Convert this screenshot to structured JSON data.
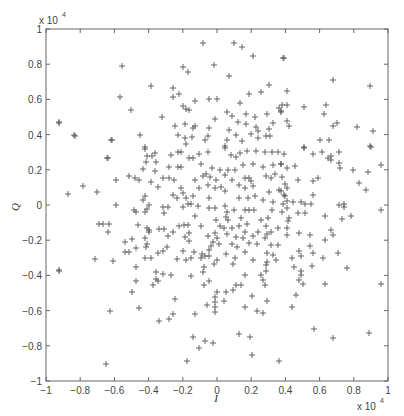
{
  "chart_data": {
    "type": "scatter",
    "title": "",
    "xlabel": "I",
    "ylabel": "Q",
    "x_multiplier_label": "x 10",
    "x_multiplier_exp": "4",
    "y_multiplier_label": "x 10",
    "y_multiplier_exp": "4",
    "xlim": [
      -1,
      1
    ],
    "ylim": [
      -1,
      1
    ],
    "grid": false,
    "legend": null,
    "marker": "+",
    "marker_color": "#555555",
    "axis_color": "#666666",
    "x_ticks": [
      -1,
      -0.8,
      -0.6,
      -0.4,
      -0.2,
      0,
      0.2,
      0.4,
      0.6,
      0.8,
      1
    ],
    "y_ticks": [
      -1,
      -0.8,
      -0.6,
      -0.4,
      -0.2,
      0,
      0.2,
      0.4,
      0.6,
      0.8,
      1
    ],
    "x_tick_labels": [
      "−1",
      "−0.8",
      "−0.6",
      "−0.4",
      "−0.2",
      "0",
      "0.2",
      "0.4",
      "0.6",
      "0.8",
      "1"
    ],
    "y_tick_labels": [
      "−1",
      "−0.8",
      "−0.6",
      "−0.4",
      "−0.2",
      "0",
      "0.2",
      "0.4",
      "0.6",
      "0.8",
      "1"
    ],
    "units_note": "values in units of 10^4",
    "points_px": [
      [
        122,
        66
      ],
      [
        151,
        86
      ],
      [
        120,
        97
      ],
      [
        131,
        110
      ],
      [
        162,
        117
      ],
      [
        59,
        122
      ],
      [
        75,
        136
      ],
      [
        112,
        140
      ],
      [
        140,
        135
      ],
      [
        145,
        147
      ],
      [
        203,
        43
      ],
      [
        234,
        43
      ],
      [
        242,
        47
      ],
      [
        253,
        56
      ],
      [
        283,
        58
      ],
      [
        183,
        67
      ],
      [
        188,
        72
      ],
      [
        214,
        65
      ],
      [
        229,
        76
      ],
      [
        173,
        88
      ],
      [
        173,
        97
      ],
      [
        179,
        94
      ],
      [
        195,
        101
      ],
      [
        209,
        99
      ],
      [
        217,
        99
      ],
      [
        240,
        103
      ],
      [
        249,
        94
      ],
      [
        261,
        92
      ],
      [
        269,
        85
      ],
      [
        183,
        106
      ],
      [
        186,
        109
      ],
      [
        189,
        110
      ],
      [
        227,
        112
      ],
      [
        232,
        116
      ],
      [
        246,
        114
      ],
      [
        255,
        117
      ],
      [
        267,
        114
      ],
      [
        279,
        108
      ],
      [
        281,
        112
      ],
      [
        215,
        119
      ],
      [
        238,
        122
      ],
      [
        246,
        124
      ],
      [
        273,
        123
      ],
      [
        175,
        126
      ],
      [
        185,
        124
      ],
      [
        193,
        128
      ],
      [
        195,
        126
      ],
      [
        209,
        128
      ],
      [
        229,
        130
      ],
      [
        256,
        127
      ],
      [
        258,
        131
      ],
      [
        269,
        129
      ],
      [
        178,
        135
      ],
      [
        185,
        138
      ],
      [
        192,
        137
      ],
      [
        208,
        136
      ],
      [
        236,
        135
      ],
      [
        251,
        134
      ],
      [
        258,
        138
      ],
      [
        266,
        136
      ],
      [
        270,
        136
      ],
      [
        205,
        140
      ],
      [
        227,
        140
      ],
      [
        242,
        141
      ],
      [
        186,
        144
      ],
      [
        225,
        146
      ],
      [
        284,
        58
      ],
      [
        333,
        80
      ],
      [
        370,
        86
      ],
      [
        287,
        91
      ],
      [
        282,
        105
      ],
      [
        287,
        105
      ],
      [
        304,
        107
      ],
      [
        326,
        105
      ],
      [
        324,
        114
      ],
      [
        281,
        111
      ],
      [
        287,
        121
      ],
      [
        289,
        126
      ],
      [
        333,
        126
      ],
      [
        337,
        123
      ],
      [
        357,
        127
      ],
      [
        373,
        131
      ],
      [
        320,
        140
      ],
      [
        329,
        140
      ],
      [
        304,
        147
      ],
      [
        370,
        146
      ],
      [
        145,
        149
      ],
      [
        155,
        153
      ],
      [
        147,
        156
      ],
      [
        152,
        156
      ],
      [
        107,
        158
      ],
      [
        146,
        162
      ],
      [
        156,
        162
      ],
      [
        143,
        169
      ],
      [
        155,
        171
      ],
      [
        129,
        176
      ],
      [
        135,
        178
      ],
      [
        139,
        180
      ],
      [
        116,
        180
      ],
      [
        163,
        178
      ],
      [
        151,
        182
      ],
      [
        83,
        186
      ],
      [
        158,
        187
      ],
      [
        97,
        192
      ],
      [
        68,
        194
      ],
      [
        145,
        196
      ],
      [
        143,
        200
      ],
      [
        149,
        205
      ],
      [
        116,
        205
      ],
      [
        163,
        207
      ],
      [
        134,
        210
      ],
      [
        136,
        212
      ],
      [
        145,
        212
      ],
      [
        147,
        209
      ],
      [
        164,
        213
      ],
      [
        99,
        224
      ],
      [
        103,
        224
      ],
      [
        109,
        224
      ],
      [
        138,
        225
      ],
      [
        147,
        228
      ],
      [
        149,
        230
      ],
      [
        159,
        229
      ],
      [
        164,
        229
      ],
      [
        108,
        232
      ],
      [
        149,
        232
      ],
      [
        145,
        238
      ],
      [
        132,
        239
      ],
      [
        125,
        242
      ],
      [
        147,
        244
      ],
      [
        136,
        248
      ],
      [
        146,
        247
      ],
      [
        125,
        252
      ],
      [
        129,
        252
      ],
      [
        158,
        253
      ],
      [
        163,
        251
      ],
      [
        95,
        259
      ],
      [
        113,
        261
      ],
      [
        145,
        258
      ],
      [
        151,
        258
      ],
      [
        108,
        158
      ],
      [
        111,
        140
      ],
      [
        74,
        135
      ],
      [
        59,
        123
      ],
      [
        171,
        155
      ],
      [
        178,
        152
      ],
      [
        181,
        152
      ],
      [
        189,
        158
      ],
      [
        193,
        158
      ],
      [
        199,
        154
      ],
      [
        208,
        152
      ],
      [
        225,
        148
      ],
      [
        231,
        155
      ],
      [
        236,
        157
      ],
      [
        240,
        153
      ],
      [
        247,
        151
      ],
      [
        256,
        151
      ],
      [
        265,
        152
      ],
      [
        272,
        152
      ],
      [
        278,
        152
      ],
      [
        284,
        154
      ],
      [
        169,
        167
      ],
      [
        178,
        167
      ],
      [
        181,
        167
      ],
      [
        201,
        164
      ],
      [
        212,
        168
      ],
      [
        220,
        170
      ],
      [
        228,
        170
      ],
      [
        235,
        170
      ],
      [
        243,
        165
      ],
      [
        253,
        164
      ],
      [
        263,
        167
      ],
      [
        273,
        165
      ],
      [
        281,
        164
      ],
      [
        169,
        178
      ],
      [
        174,
        180
      ],
      [
        195,
        180
      ],
      [
        203,
        176
      ],
      [
        206,
        174
      ],
      [
        210,
        177
      ],
      [
        216,
        180
      ],
      [
        225,
        175
      ],
      [
        232,
        180
      ],
      [
        245,
        178
      ],
      [
        249,
        178
      ],
      [
        251,
        181
      ],
      [
        266,
        176
      ],
      [
        271,
        178
      ],
      [
        275,
        174
      ],
      [
        181,
        188
      ],
      [
        183,
        193
      ],
      [
        199,
        188
      ],
      [
        208,
        185
      ],
      [
        215,
        188
      ],
      [
        221,
        187
      ],
      [
        225,
        191
      ],
      [
        239,
        185
      ],
      [
        245,
        188
      ],
      [
        253,
        186
      ],
      [
        269,
        192
      ],
      [
        279,
        190
      ],
      [
        284,
        195
      ],
      [
        173,
        195
      ],
      [
        177,
        198
      ],
      [
        186,
        198
      ],
      [
        193,
        196
      ],
      [
        209,
        198
      ],
      [
        239,
        198
      ],
      [
        248,
        198
      ],
      [
        255,
        196
      ],
      [
        263,
        200
      ],
      [
        273,
        202
      ],
      [
        168,
        207
      ],
      [
        183,
        207
      ],
      [
        188,
        204
      ],
      [
        191,
        204
      ],
      [
        198,
        206
      ],
      [
        209,
        208
      ],
      [
        215,
        208
      ],
      [
        225,
        206
      ],
      [
        227,
        212
      ],
      [
        234,
        210
      ],
      [
        245,
        210
      ],
      [
        249,
        210
      ],
      [
        254,
        210
      ],
      [
        272,
        210
      ],
      [
        283,
        204
      ],
      [
        195,
        216
      ],
      [
        216,
        220
      ],
      [
        226,
        217
      ],
      [
        228,
        220
      ],
      [
        241,
        218
      ],
      [
        261,
        220
      ],
      [
        268,
        218
      ],
      [
        179,
        226
      ],
      [
        184,
        225
      ],
      [
        188,
        225
      ],
      [
        201,
        226
      ],
      [
        220,
        226
      ],
      [
        224,
        228
      ],
      [
        232,
        228
      ],
      [
        239,
        226
      ],
      [
        247,
        224
      ],
      [
        266,
        226
      ],
      [
        278,
        228
      ],
      [
        173,
        232
      ],
      [
        189,
        233
      ],
      [
        215,
        233
      ],
      [
        227,
        234
      ],
      [
        245,
        232
      ],
      [
        258,
        232
      ],
      [
        267,
        234
      ],
      [
        271,
        232
      ],
      [
        168,
        236
      ],
      [
        185,
        237
      ],
      [
        208,
        236
      ],
      [
        217,
        238
      ],
      [
        236,
        237
      ],
      [
        243,
        238
      ],
      [
        253,
        236
      ],
      [
        265,
        238
      ],
      [
        189,
        241
      ],
      [
        213,
        242
      ],
      [
        219,
        244
      ],
      [
        232,
        244
      ],
      [
        249,
        243
      ],
      [
        257,
        244
      ],
      [
        271,
        245
      ],
      [
        278,
        245
      ],
      [
        167,
        247
      ],
      [
        211,
        246
      ],
      [
        237,
        247
      ],
      [
        183,
        251
      ],
      [
        194,
        252
      ],
      [
        202,
        254
      ],
      [
        209,
        250
      ],
      [
        226,
        254
      ],
      [
        245,
        252
      ],
      [
        267,
        253
      ],
      [
        273,
        255
      ],
      [
        177,
        259
      ],
      [
        186,
        260
      ],
      [
        191,
        258
      ],
      [
        201,
        258
      ],
      [
        205,
        256
      ],
      [
        209,
        256
      ],
      [
        217,
        260
      ],
      [
        235,
        258
      ],
      [
        253,
        260
      ],
      [
        267,
        262
      ],
      [
        276,
        260
      ],
      [
        304,
        148
      ],
      [
        313,
        154
      ],
      [
        322,
        152
      ],
      [
        328,
        158
      ],
      [
        331,
        156
      ],
      [
        331,
        160
      ],
      [
        339,
        152
      ],
      [
        371,
        147
      ],
      [
        281,
        164
      ],
      [
        287,
        168
      ],
      [
        295,
        166
      ],
      [
        339,
        163
      ],
      [
        340,
        168
      ],
      [
        353,
        170
      ],
      [
        368,
        172
      ],
      [
        381,
        165
      ],
      [
        282,
        177
      ],
      [
        298,
        180
      ],
      [
        313,
        181
      ],
      [
        318,
        178
      ],
      [
        359,
        183
      ],
      [
        366,
        190
      ],
      [
        285,
        184
      ],
      [
        287,
        188
      ],
      [
        281,
        191
      ],
      [
        285,
        196
      ],
      [
        313,
        195
      ],
      [
        287,
        201
      ],
      [
        293,
        202
      ],
      [
        301,
        202
      ],
      [
        305,
        204
      ],
      [
        311,
        204
      ],
      [
        339,
        205
      ],
      [
        344,
        204
      ],
      [
        344,
        207
      ],
      [
        287,
        208
      ],
      [
        282,
        212
      ],
      [
        298,
        213
      ],
      [
        305,
        213
      ],
      [
        381,
        210
      ],
      [
        289,
        218
      ],
      [
        288,
        221
      ],
      [
        325,
        216
      ],
      [
        342,
        219
      ],
      [
        351,
        216
      ],
      [
        287,
        228
      ],
      [
        287,
        235
      ],
      [
        299,
        233
      ],
      [
        310,
        235
      ],
      [
        331,
        230
      ],
      [
        333,
        235
      ],
      [
        325,
        240
      ],
      [
        310,
        246
      ],
      [
        299,
        251
      ],
      [
        313,
        253
      ],
      [
        301,
        256
      ],
      [
        338,
        253
      ],
      [
        292,
        258
      ],
      [
        323,
        258
      ],
      [
        59,
        271
      ],
      [
        136,
        267
      ],
      [
        136,
        281
      ],
      [
        156,
        272
      ],
      [
        163,
        274
      ],
      [
        156,
        279
      ],
      [
        158,
        281
      ],
      [
        153,
        285
      ],
      [
        132,
        292
      ],
      [
        110,
        311
      ],
      [
        139,
        308
      ],
      [
        159,
        321
      ],
      [
        106,
        364
      ],
      [
        59,
        270
      ],
      [
        171,
        275
      ],
      [
        191,
        276
      ],
      [
        203,
        272
      ],
      [
        204,
        267
      ],
      [
        214,
        264
      ],
      [
        233,
        264
      ],
      [
        245,
        275
      ],
      [
        266,
        265
      ],
      [
        261,
        275
      ],
      [
        266,
        271
      ],
      [
        263,
        280
      ],
      [
        265,
        285
      ],
      [
        209,
        281
      ],
      [
        204,
        285
      ],
      [
        236,
        285
      ],
      [
        241,
        285
      ],
      [
        233,
        290
      ],
      [
        226,
        292
      ],
      [
        217,
        292
      ],
      [
        215,
        297
      ],
      [
        215,
        302
      ],
      [
        224,
        301
      ],
      [
        252,
        296
      ],
      [
        267,
        301
      ],
      [
        175,
        299
      ],
      [
        207,
        305
      ],
      [
        215,
        307
      ],
      [
        245,
        307
      ],
      [
        215,
        312
      ],
      [
        257,
        311
      ],
      [
        263,
        313
      ],
      [
        173,
        314
      ],
      [
        169,
        319
      ],
      [
        195,
        314
      ],
      [
        239,
        334
      ],
      [
        250,
        337
      ],
      [
        193,
        337
      ],
      [
        205,
        341
      ],
      [
        213,
        343
      ],
      [
        199,
        348
      ],
      [
        252,
        355
      ],
      [
        187,
        361
      ],
      [
        279,
        361
      ],
      [
        294,
        267
      ],
      [
        301,
        271
      ],
      [
        301,
        275
      ],
      [
        299,
        280
      ],
      [
        303,
        284
      ],
      [
        312,
        266
      ],
      [
        347,
        268
      ],
      [
        325,
        284
      ],
      [
        381,
        284
      ],
      [
        296,
        295
      ],
      [
        292,
        307
      ],
      [
        314,
        329
      ],
      [
        333,
        338
      ],
      [
        369,
        333
      ]
    ],
    "plot_area_px": {
      "left": 46,
      "top": 29,
      "right": 388,
      "bottom": 381
    }
  }
}
